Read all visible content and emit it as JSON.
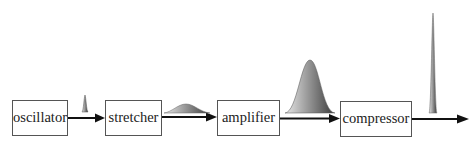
{
  "diagram": {
    "type": "block-flow",
    "blocks": [
      {
        "id": "oscillator",
        "label": "oscillator"
      },
      {
        "id": "stretcher",
        "label": "stretcher"
      },
      {
        "id": "amplifier",
        "label": "amplifier"
      },
      {
        "id": "compressor",
        "label": "compressor"
      }
    ],
    "edges": [
      {
        "from": "oscillator",
        "to": "stretcher",
        "pulse": "short-narrow"
      },
      {
        "from": "stretcher",
        "to": "amplifier",
        "pulse": "stretched-low"
      },
      {
        "from": "amplifier",
        "to": "compressor",
        "pulse": "amplified-wide"
      },
      {
        "from": "compressor",
        "to": "output",
        "pulse": "compressed-tall"
      }
    ],
    "pulse_gradient": {
      "light": "#e6e6e6",
      "dark": "#444444"
    }
  }
}
